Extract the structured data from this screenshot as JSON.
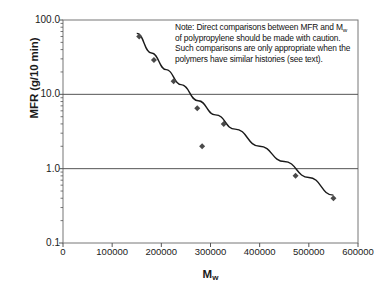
{
  "chart_data": {
    "type": "scatter",
    "title": "",
    "subtitle": "",
    "xlabel": "Mw",
    "xlabel_base": "M",
    "xlabel_sub": "w",
    "ylabel": "MFR (g/10 min)",
    "xscale": "linear",
    "yscale": "log",
    "xlim": [
      0,
      600000
    ],
    "ylim": [
      0.1,
      100.0
    ],
    "grid": "horizontal-major-only",
    "legend": "none",
    "xticks": [
      0,
      100000,
      200000,
      300000,
      400000,
      500000,
      600000
    ],
    "xtick_labels": [
      "0",
      "100000",
      "200000",
      "300000",
      "400000",
      "500000",
      "600000"
    ],
    "yticks": [
      0.1,
      1.0,
      10.0,
      100.0
    ],
    "ytick_labels": [
      "0.1",
      "1.0",
      "10.0",
      "100.0"
    ],
    "marker": "diamond",
    "marker_color": "#4a4a4a",
    "line_color": "#1a1a1a",
    "series": [
      {
        "name": "MFR vs Mw",
        "x": [
          155000,
          185000,
          225000,
          273000,
          283000,
          327000,
          473000,
          550000
        ],
        "y": [
          60.0,
          29.0,
          15.0,
          6.5,
          2.0,
          4.0,
          0.8,
          0.4
        ]
      }
    ],
    "trend_curve": {
      "name": "fitted power-law trend",
      "x": [
        150000,
        180000,
        210000,
        240000,
        275000,
        310000,
        350000,
        400000,
        450000,
        500000,
        550000
      ],
      "y": [
        66.0,
        36.0,
        21.5,
        13.5,
        8.2,
        5.3,
        3.4,
        2.0,
        1.25,
        0.76,
        0.44
      ]
    },
    "annotations": [
      {
        "name": "caution-note",
        "text": "Note: Direct comparisons between MFR and Mw of polypropylene should be made with caution. Such comparisons are only appropriate when the polymers have similar histories (see text).",
        "line1_a": "Note: Direct comparisons between MFR",
        "line2_a": "and M",
        "line2_sub": "w",
        "line2_b": " of polypropylene should be",
        "line3": "made with caution. Such comparisons",
        "line4": "are only appropriate when the polymers",
        "line5": "have similar histories (see text)."
      }
    ],
    "colors": {
      "axis": "#555555",
      "gridline": "#555555",
      "frame": "#777777",
      "text": "#1a1a1a"
    }
  }
}
